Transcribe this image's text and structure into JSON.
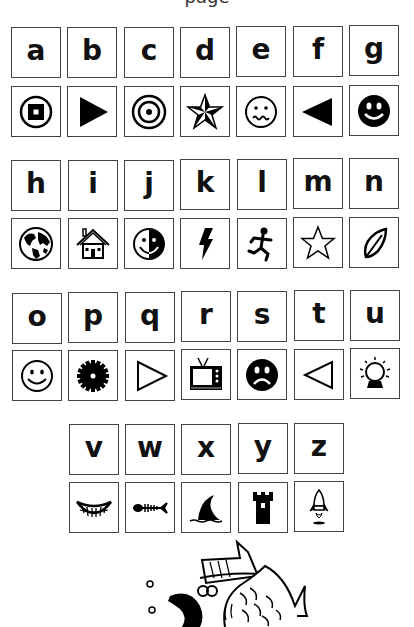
{
  "header": {
    "text": "page"
  },
  "rows": [
    {
      "letters": [
        "a",
        "b",
        "c",
        "d",
        "e",
        "f",
        "g"
      ],
      "icons": [
        "square-in-circle-icon",
        "play-triangle-right-icon",
        "bullseye-icon",
        "nautical-star-icon",
        "worried-face-icon",
        "triangle-left-filled-icon",
        "smiley-filled-icon"
      ]
    },
    {
      "letters": [
        "h",
        "i",
        "j",
        "k",
        "l",
        "m",
        "n"
      ],
      "icons": [
        "globe-icon",
        "house-icon",
        "half-smiley-icon",
        "lightning-icon",
        "running-person-icon",
        "star-outline-icon",
        "leaf-icon"
      ]
    },
    {
      "letters": [
        "o",
        "p",
        "q",
        "r",
        "s",
        "t",
        "u"
      ],
      "icons": [
        "smiley-outline-icon",
        "gear-icon",
        "triangle-right-outline-icon",
        "television-icon",
        "sad-face-filled-icon",
        "triangle-left-outline-icon",
        "light-bulb-icon"
      ]
    },
    {
      "letters": [
        "v",
        "w",
        "x",
        "y",
        "z"
      ],
      "icons": [
        "grin-icon",
        "fish-skeleton-icon",
        "shark-fin-icon",
        "castle-tower-icon",
        "rocket-icon"
      ]
    }
  ],
  "illustration": "fish-with-hat-illustration"
}
